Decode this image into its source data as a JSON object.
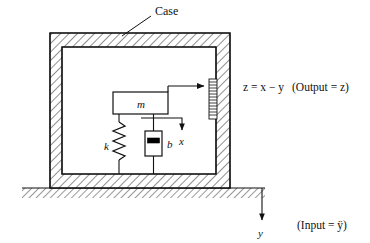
{
  "figure": {
    "title_label": "Case",
    "ink_color": "#111111",
    "hatch_color": "#333333",
    "fill_color": "#ffffff",
    "piston_color": "#000000"
  },
  "labels": {
    "case": "Case",
    "mass": "m",
    "spring": "k",
    "damper": "b",
    "relative_displacement": "x",
    "ground_displacement": "y",
    "output_equation": "z = x − y",
    "output_note": "(Output = z)",
    "input_note": "(Input = ÿ)"
  },
  "elements": {
    "case_outer": {
      "x": 50,
      "y": 33,
      "w": 180,
      "h": 155
    },
    "case_inner": {
      "x": 62,
      "y": 47,
      "w": 154,
      "h": 127
    },
    "mass_block": {
      "x": 113,
      "y": 92,
      "w": 55,
      "h": 22
    },
    "damper_body": {
      "x": 145,
      "y": 131,
      "w": 17,
      "h": 25
    },
    "damper_piston": {
      "x": 148,
      "y": 139,
      "w": 12,
      "h": 5
    },
    "scale_strip": {
      "x": 209,
      "y": 79,
      "w": 8,
      "h": 40,
      "tick_count": 14
    },
    "spring_x": 119,
    "spring_top": 118,
    "spring_bottom": 168,
    "spring_zigs": 7,
    "ground_y": 188,
    "ground_x_start": 22,
    "ground_x_end": 265,
    "y_arrow_x": 262,
    "y_arrow_top": 188,
    "y_arrow_bottom": 222,
    "x_arrow_x": 182,
    "x_arrow_top": 114,
    "x_arrow_bottom": 132,
    "z_arrow_y": 86,
    "z_arrow_x_start": 168,
    "z_arrow_x_end": 206,
    "case_leader_from": [
      152,
      14
    ],
    "case_leader_to": [
      121,
      36
    ]
  },
  "text_positions": {
    "case": [
      155,
      13
    ],
    "mass": [
      141,
      107
    ],
    "spring": [
      108,
      148
    ],
    "damper": [
      167,
      147
    ],
    "x": [
      184,
      143
    ],
    "y": [
      259,
      236
    ],
    "output_equation": [
      243,
      90
    ],
    "output_note": [
      291,
      90
    ],
    "input_note": [
      296,
      228
    ]
  }
}
